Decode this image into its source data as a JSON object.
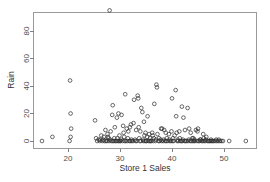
{
  "chart_data": {
    "type": "scatter",
    "title": "",
    "xlabel": "Store 1 Sales",
    "ylabel": "Rain",
    "xlim": [
      13.5,
      55.5
    ],
    "ylim": [
      -3,
      98
    ],
    "xticks": [
      20,
      30,
      40,
      50
    ],
    "yticks": [
      0,
      20,
      40,
      60,
      80
    ],
    "xtick_labels": [
      "20",
      "30",
      "40",
      "50"
    ],
    "ytick_labels": [
      "0",
      "20",
      "40",
      "60",
      "80"
    ],
    "grid": false,
    "legend": null,
    "marker": "open-circle",
    "marker_color": "#2b2b2b",
    "panel_border_color": "#9a9a9a",
    "background": "#ffffff",
    "points": [
      [
        15.0,
        0
      ],
      [
        17.0,
        3
      ],
      [
        20.4,
        44
      ],
      [
        20.5,
        20
      ],
      [
        20.6,
        9
      ],
      [
        20.5,
        3
      ],
      [
        20.3,
        0
      ],
      [
        25.2,
        15
      ],
      [
        25.4,
        2
      ],
      [
        25.6,
        0
      ],
      [
        25.9,
        1
      ],
      [
        26.1,
        0
      ],
      [
        26.4,
        4
      ],
      [
        26.6,
        0
      ],
      [
        26.8,
        1
      ],
      [
        27.0,
        0
      ],
      [
        27.2,
        8
      ],
      [
        27.3,
        0
      ],
      [
        27.5,
        0
      ],
      [
        27.7,
        3
      ],
      [
        27.9,
        0
      ],
      [
        28.0,
        95
      ],
      [
        28.1,
        1
      ],
      [
        28.3,
        0
      ],
      [
        28.5,
        19
      ],
      [
        28.6,
        0
      ],
      [
        28.8,
        0
      ],
      [
        29.0,
        10
      ],
      [
        29.1,
        0
      ],
      [
        29.3,
        0
      ],
      [
        29.5,
        2
      ],
      [
        29.6,
        0
      ],
      [
        29.8,
        0
      ],
      [
        30.0,
        0
      ],
      [
        30.1,
        0
      ],
      [
        28.6,
        26
      ],
      [
        29.4,
        17
      ],
      [
        29.7,
        20
      ],
      [
        30.3,
        19
      ],
      [
        30.5,
        0
      ],
      [
        30.7,
        6
      ],
      [
        30.9,
        0
      ],
      [
        31.0,
        34
      ],
      [
        31.1,
        0
      ],
      [
        31.3,
        9
      ],
      [
        31.4,
        0
      ],
      [
        31.6,
        7
      ],
      [
        31.8,
        0
      ],
      [
        32.0,
        0
      ],
      [
        32.1,
        12
      ],
      [
        32.3,
        0
      ],
      [
        32.5,
        0
      ],
      [
        32.7,
        30
      ],
      [
        32.9,
        1
      ],
      [
        33.0,
        0
      ],
      [
        33.2,
        0
      ],
      [
        33.4,
        33
      ],
      [
        33.5,
        31
      ],
      [
        33.6,
        10
      ],
      [
        33.8,
        0
      ],
      [
        34.0,
        0
      ],
      [
        34.1,
        24
      ],
      [
        34.3,
        21
      ],
      [
        34.5,
        0
      ],
      [
        34.6,
        14
      ],
      [
        34.8,
        0
      ],
      [
        35.0,
        0
      ],
      [
        35.1,
        0
      ],
      [
        35.3,
        18
      ],
      [
        35.5,
        0
      ],
      [
        35.7,
        0
      ],
      [
        35.9,
        0
      ],
      [
        36.0,
        0
      ],
      [
        36.2,
        6
      ],
      [
        36.4,
        0
      ],
      [
        36.6,
        27
      ],
      [
        36.8,
        0
      ],
      [
        37.0,
        41
      ],
      [
        37.1,
        39
      ],
      [
        37.2,
        5
      ],
      [
        37.4,
        0
      ],
      [
        37.6,
        0
      ],
      [
        37.8,
        1
      ],
      [
        38.0,
        0
      ],
      [
        38.1,
        9
      ],
      [
        38.3,
        0
      ],
      [
        38.5,
        8
      ],
      [
        38.7,
        0
      ],
      [
        38.9,
        0
      ],
      [
        39.0,
        2
      ],
      [
        39.2,
        0
      ],
      [
        39.4,
        5
      ],
      [
        39.6,
        0
      ],
      [
        39.8,
        0
      ],
      [
        40.0,
        31
      ],
      [
        40.1,
        0
      ],
      [
        40.3,
        0
      ],
      [
        40.5,
        4
      ],
      [
        40.7,
        37
      ],
      [
        40.8,
        18
      ],
      [
        41.0,
        0
      ],
      [
        41.2,
        0
      ],
      [
        41.4,
        7
      ],
      [
        41.6,
        0
      ],
      [
        41.8,
        0
      ],
      [
        41.9,
        25
      ],
      [
        42.0,
        0
      ],
      [
        42.2,
        17
      ],
      [
        42.4,
        0
      ],
      [
        42.6,
        0
      ],
      [
        42.8,
        0
      ],
      [
        43.0,
        24
      ],
      [
        43.1,
        0
      ],
      [
        43.3,
        9
      ],
      [
        43.5,
        0
      ],
      [
        43.7,
        0
      ],
      [
        43.9,
        2
      ],
      [
        44.0,
        0
      ],
      [
        44.2,
        0
      ],
      [
        44.4,
        0
      ],
      [
        44.6,
        8
      ],
      [
        44.8,
        0
      ],
      [
        45.0,
        9
      ],
      [
        45.1,
        0
      ],
      [
        45.3,
        0
      ],
      [
        45.5,
        1
      ],
      [
        45.7,
        0
      ],
      [
        45.9,
        0
      ],
      [
        46.0,
        5
      ],
      [
        46.2,
        0
      ],
      [
        46.4,
        0
      ],
      [
        46.6,
        3
      ],
      [
        46.8,
        0
      ],
      [
        47.0,
        0
      ],
      [
        47.2,
        0
      ],
      [
        47.4,
        0
      ],
      [
        47.6,
        0
      ],
      [
        47.8,
        0
      ],
      [
        48.0,
        0
      ],
      [
        48.3,
        0
      ],
      [
        48.6,
        0
      ],
      [
        48.9,
        0
      ],
      [
        49.2,
        0
      ],
      [
        49.5,
        0
      ],
      [
        49.8,
        0
      ],
      [
        51.0,
        0
      ],
      [
        54.2,
        0
      ],
      [
        33.1,
        8
      ],
      [
        33.9,
        7
      ],
      [
        34.9,
        6
      ],
      [
        35.6,
        5
      ],
      [
        36.3,
        4
      ],
      [
        30.6,
        11
      ],
      [
        31.9,
        10
      ],
      [
        32.6,
        13
      ],
      [
        28.2,
        7
      ],
      [
        27.6,
        5
      ],
      [
        26.9,
        3
      ],
      [
        37.9,
        9
      ],
      [
        38.8,
        6
      ],
      [
        39.9,
        7
      ],
      [
        40.9,
        6
      ],
      [
        42.5,
        8
      ],
      [
        43.6,
        6
      ],
      [
        44.9,
        7
      ],
      [
        29.9,
        4
      ],
      [
        30.8,
        3
      ],
      [
        31.5,
        2
      ],
      [
        34.4,
        1
      ],
      [
        35.8,
        2
      ],
      [
        36.9,
        1
      ],
      [
        38.4,
        1
      ],
      [
        39.5,
        1
      ],
      [
        41.1,
        1
      ],
      [
        42.1,
        1
      ],
      [
        43.2,
        1
      ],
      [
        44.3,
        1
      ],
      [
        45.4,
        1
      ],
      [
        46.5,
        1
      ],
      [
        47.5,
        1
      ],
      [
        48.5,
        1
      ],
      [
        49.0,
        1
      ],
      [
        26.2,
        1
      ],
      [
        27.8,
        2
      ],
      [
        28.9,
        2
      ],
      [
        32.2,
        1
      ],
      [
        33.7,
        2
      ],
      [
        36.5,
        2
      ],
      [
        37.5,
        2
      ],
      [
        40.2,
        2
      ],
      [
        41.5,
        2
      ],
      [
        44.1,
        2
      ],
      [
        46.1,
        2
      ],
      [
        30.2,
        1
      ],
      [
        34.7,
        4
      ],
      [
        35.2,
        3
      ]
    ]
  },
  "axes": {
    "x_title": "Store 1 Sales",
    "y_title": "Rain"
  }
}
